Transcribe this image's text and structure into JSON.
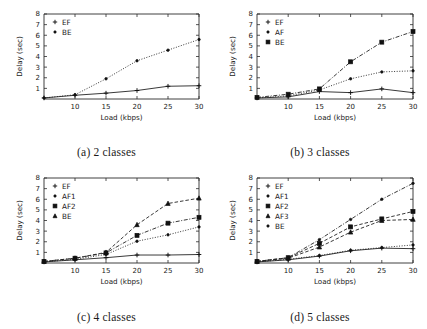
{
  "figure": {
    "panel_count": 4,
    "axis": {
      "xlabel": "Load (kbps)",
      "ylabel": "Delay (sec)",
      "xticks": [
        10,
        15,
        20,
        25,
        30
      ],
      "yticks": [
        1,
        2,
        3,
        4,
        5,
        6,
        7,
        8
      ],
      "xlim": [
        5,
        30
      ],
      "ylim": [
        0,
        8
      ]
    },
    "captions": {
      "a": "(a) 2 classes",
      "b": "(b) 3 classes",
      "c": "(c) 4 classes",
      "d": "(d) 5 classes"
    }
  },
  "chart_data": [
    {
      "id": "a",
      "type": "line",
      "title": "(a) 2 classes",
      "xlabel": "Load (kbps)",
      "ylabel": "Delay (sec)",
      "x": [
        5,
        10,
        15,
        20,
        25,
        30
      ],
      "xlim": [
        5,
        30
      ],
      "ylim": [
        0,
        8
      ],
      "xticks": [
        10,
        15,
        20,
        25,
        30
      ],
      "yticks": [
        1,
        2,
        3,
        4,
        5,
        6,
        7,
        8
      ],
      "grid": false,
      "legend_position": "top-left",
      "series": [
        {
          "name": "EF",
          "marker": "plus",
          "dash": "solid",
          "values": [
            0.1,
            0.35,
            0.55,
            0.8,
            1.2,
            1.25
          ]
        },
        {
          "name": "BE",
          "marker": "dot",
          "dash": "dotted",
          "values": [
            0.1,
            0.4,
            1.9,
            3.6,
            4.6,
            5.6
          ]
        }
      ]
    },
    {
      "id": "b",
      "type": "line",
      "title": "(b) 3 classes",
      "xlabel": "Load (kbps)",
      "ylabel": "Delay (sec)",
      "x": [
        5,
        10,
        15,
        20,
        25,
        30
      ],
      "xlim": [
        5,
        30
      ],
      "ylim": [
        0,
        8
      ],
      "xticks": [
        10,
        15,
        20,
        25,
        30
      ],
      "yticks": [
        1,
        2,
        3,
        4,
        5,
        6,
        7,
        8
      ],
      "grid": false,
      "legend_position": "top-left",
      "series": [
        {
          "name": "EF",
          "marker": "plus",
          "dash": "solid",
          "values": [
            0.1,
            0.2,
            0.7,
            0.6,
            0.95,
            0.6
          ]
        },
        {
          "name": "AF",
          "marker": "dot",
          "dash": "dotted",
          "values": [
            0.1,
            0.3,
            0.85,
            1.9,
            2.55,
            2.65
          ]
        },
        {
          "name": "BE",
          "marker": "square",
          "dash": "dashdot",
          "values": [
            0.15,
            0.45,
            0.95,
            3.5,
            5.35,
            6.35
          ]
        }
      ]
    },
    {
      "id": "c",
      "type": "line",
      "title": "(c) 4 classes",
      "xlabel": "Load (kbps)",
      "ylabel": "Delay (sec)",
      "x": [
        5,
        10,
        15,
        20,
        25,
        30
      ],
      "xlim": [
        5,
        30
      ],
      "ylim": [
        0,
        8
      ],
      "xticks": [
        10,
        15,
        20,
        25,
        30
      ],
      "yticks": [
        1,
        2,
        3,
        4,
        5,
        6,
        7,
        8
      ],
      "grid": false,
      "legend_position": "top-left",
      "series": [
        {
          "name": "EF",
          "marker": "plus",
          "dash": "solid",
          "values": [
            0.1,
            0.3,
            0.5,
            0.75,
            0.75,
            0.8
          ]
        },
        {
          "name": "AF1",
          "marker": "dot",
          "dash": "dotted",
          "values": [
            0.1,
            0.35,
            0.8,
            2.05,
            2.65,
            3.4
          ]
        },
        {
          "name": "AF2",
          "marker": "square",
          "dash": "dashdot",
          "values": [
            0.15,
            0.45,
            0.95,
            2.6,
            3.75,
            4.3
          ]
        },
        {
          "name": "BE",
          "marker": "triangle",
          "dash": "dashed",
          "values": [
            0.15,
            0.45,
            1.0,
            3.6,
            5.6,
            6.1
          ]
        }
      ]
    },
    {
      "id": "d",
      "type": "line",
      "title": "(d) 5 classes",
      "xlabel": "Load (kbps)",
      "ylabel": "Delay (sec)",
      "x": [
        5,
        10,
        15,
        20,
        25,
        30
      ],
      "xlim": [
        5,
        30
      ],
      "ylim": [
        0,
        8
      ],
      "xticks": [
        10,
        15,
        20,
        25,
        30
      ],
      "yticks": [
        1,
        2,
        3,
        4,
        5,
        6,
        7,
        8
      ],
      "grid": false,
      "legend_position": "top-left",
      "series": [
        {
          "name": "EF",
          "marker": "plus",
          "dash": "solid",
          "values": [
            0.1,
            0.3,
            0.65,
            1.15,
            1.4,
            1.35
          ]
        },
        {
          "name": "AF1",
          "marker": "dot",
          "dash": "dotted",
          "values": [
            0.1,
            0.35,
            0.7,
            1.2,
            1.45,
            1.7
          ]
        },
        {
          "name": "AF2",
          "marker": "square",
          "dash": "dashed",
          "values": [
            0.15,
            0.5,
            1.85,
            3.4,
            4.15,
            4.85
          ]
        },
        {
          "name": "AF3",
          "marker": "triangle",
          "dash": "dashed",
          "values": [
            0.15,
            0.45,
            1.5,
            2.9,
            4.0,
            4.1
          ]
        },
        {
          "name": "BE",
          "marker": "dot",
          "dash": "dashdot",
          "values": [
            0.15,
            0.5,
            2.2,
            4.1,
            6.0,
            7.5
          ]
        }
      ]
    }
  ]
}
